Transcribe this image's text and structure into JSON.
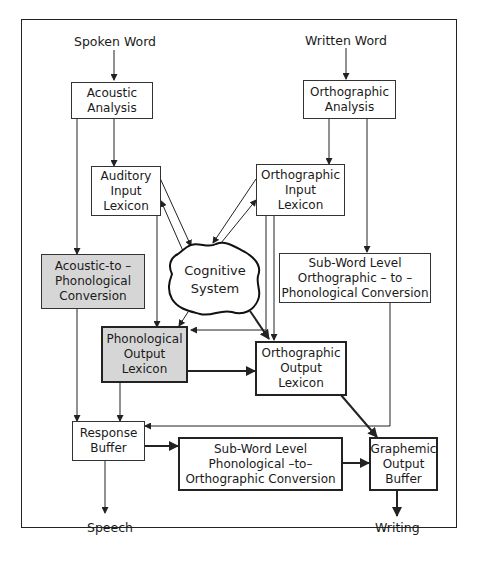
{
  "diagram": {
    "type": "cognitive-neuropsychological model of spelling and speech",
    "inputs": {
      "spoken_word": "Spoken Word",
      "written_word": "Written Word"
    },
    "outputs": {
      "speech": "Speech",
      "writing": "Writing"
    },
    "nodes": {
      "acoustic_analysis": "Acoustic\nAnalysis",
      "orthographic_analysis": "Orthographic\nAnalysis",
      "auditory_input_lexicon": "Auditory\nInput\nLexicon",
      "orthographic_input_lexicon": "Orthographic\nInput\nLexicon",
      "acoustic_to_phonological": "Acoustic-to –\nPhonological\nConversion",
      "cognitive_system": "Cognitive\nSystem",
      "subword_orth_to_phon": "Sub-Word Level\nOrthographic – to –\nPhonological Conversion",
      "phonological_output_lexicon": "Phonological\nOutput\nLexicon",
      "orthographic_output_lexicon": "Orthographic\nOutput\nLexicon",
      "response_buffer": "Response\nBuffer",
      "subword_phon_to_orth": "Sub-Word Level\nPhonological –to–\nOrthographic Conversion",
      "graphemic_output_buffer": "Graphemic\nOutput\nBuffer"
    },
    "edges": [
      [
        "Spoken Word",
        "Acoustic Analysis"
      ],
      [
        "Acoustic Analysis",
        "Auditory Input Lexicon"
      ],
      [
        "Acoustic Analysis",
        "Acoustic-to-Phonological Conversion"
      ],
      [
        "Auditory Input Lexicon",
        "Cognitive System"
      ],
      [
        "Cognitive System",
        "Auditory Input Lexicon"
      ],
      [
        "Auditory Input Lexicon",
        "Phonological Output Lexicon"
      ],
      [
        "Written Word",
        "Orthographic Analysis"
      ],
      [
        "Orthographic Analysis",
        "Orthographic Input Lexicon"
      ],
      [
        "Orthographic Analysis",
        "Sub-Word Level Orthographic-to-Phonological Conversion"
      ],
      [
        "Orthographic Input Lexicon",
        "Cognitive System"
      ],
      [
        "Cognitive System",
        "Orthographic Input Lexicon"
      ],
      [
        "Orthographic Input Lexicon",
        "Phonological Output Lexicon"
      ],
      [
        "Orthographic Input Lexicon",
        "Orthographic Output Lexicon"
      ],
      [
        "Cognitive System",
        "Phonological Output Lexicon"
      ],
      [
        "Cognitive System",
        "Orthographic Output Lexicon"
      ],
      [
        "Acoustic-to-Phonological Conversion",
        "Response Buffer"
      ],
      [
        "Phonological Output Lexicon",
        "Orthographic Output Lexicon"
      ],
      [
        "Phonological Output Lexicon",
        "Response Buffer"
      ],
      [
        "Sub-Word Level Orthographic-to-Phonological Conversion",
        "Response Buffer"
      ],
      [
        "Orthographic Output Lexicon",
        "Graphemic Output Buffer"
      ],
      [
        "Response Buffer",
        "Sub-Word Level Phonological-to-Orthographic Conversion"
      ],
      [
        "Sub-Word Level Phonological-to-Orthographic Conversion",
        "Graphemic Output Buffer"
      ],
      [
        "Response Buffer",
        "Speech"
      ],
      [
        "Graphemic Output Buffer",
        "Writing"
      ]
    ],
    "colors": {
      "line": "#222222",
      "shaded_box": "#d6d6d6",
      "background": "#ffffff"
    }
  }
}
